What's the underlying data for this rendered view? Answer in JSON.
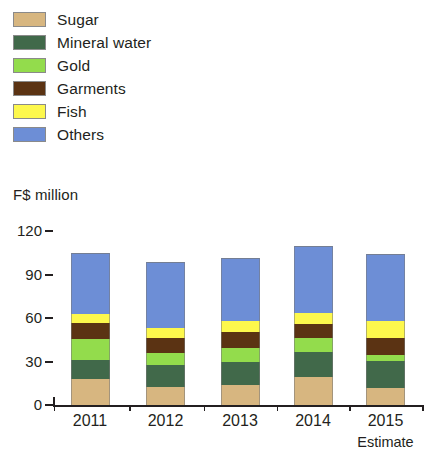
{
  "chart_data": {
    "type": "bar",
    "subtype": "stacked-vertical",
    "title": "",
    "xlabel": "",
    "ylabel": "F$ million",
    "categories": [
      "2011",
      "2012",
      "2013",
      "2014",
      "2015"
    ],
    "yticks": [
      0,
      30,
      60,
      90,
      120
    ],
    "ylim": [
      0,
      120
    ],
    "grid": false,
    "legend_position": "top-left",
    "annotations": [
      "Estimate"
    ],
    "annotation_target": "2015",
    "series": [
      {
        "name": "Sugar",
        "color": "#d7b680",
        "values": [
          17.7,
          12.6,
          13.8,
          19.5,
          11.9
        ]
      },
      {
        "name": "Mineral water",
        "color": "#41694a",
        "values": [
          13.3,
          15.0,
          16.1,
          17.2,
          18.4
        ]
      },
      {
        "name": "Gold",
        "color": "#93dc4c",
        "values": [
          14.3,
          8.0,
          9.2,
          9.2,
          4.1
        ]
      },
      {
        "name": "Garments",
        "color": "#5b3313",
        "values": [
          11.0,
          10.8,
          11.0,
          9.7,
          11.9
        ]
      },
      {
        "name": "Fish",
        "color": "#fdf84c",
        "values": [
          6.4,
          6.9,
          7.8,
          7.6,
          11.5
        ]
      },
      {
        "name": "Others",
        "color": "#6d8ed6",
        "values": [
          41.9,
          45.1,
          43.7,
          46.6,
          46.0
        ]
      }
    ],
    "totals": [
      104.6,
      98.4,
      101.6,
      109.8,
      103.8
    ]
  },
  "legend": {
    "items": [
      {
        "label": "Sugar",
        "swatch": "legend-swatch-sugar"
      },
      {
        "label": "Mineral water",
        "swatch": "legend-swatch-mineral-water"
      },
      {
        "label": "Gold",
        "swatch": "legend-swatch-gold"
      },
      {
        "label": "Garments",
        "swatch": "legend-swatch-garments"
      },
      {
        "label": "Fish",
        "swatch": "legend-swatch-fish"
      },
      {
        "label": "Others",
        "swatch": "legend-swatch-others"
      }
    ]
  },
  "axis": {
    "y_title": "F$ million",
    "y_tick_labels": [
      "120",
      "90",
      "60",
      "30",
      "0"
    ],
    "x_tick_labels": [
      "2011",
      "2012",
      "2013",
      "2014",
      "2015"
    ],
    "estimate_note": "Estimate"
  }
}
